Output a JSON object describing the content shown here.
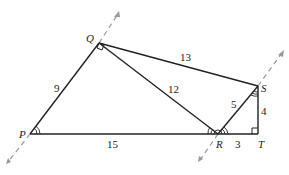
{
  "diagram": {
    "type": "geometry",
    "points": {
      "P": {
        "label": "P",
        "x": 30,
        "y": 134
      },
      "Q": {
        "label": "Q",
        "x": 99,
        "y": 43
      },
      "R": {
        "label": "R",
        "x": 218,
        "y": 134
      },
      "S": {
        "label": "S",
        "x": 258,
        "y": 86
      },
      "T": {
        "label": "T",
        "x": 258,
        "y": 134
      }
    },
    "segments": [
      {
        "from": "P",
        "to": "Q",
        "length_label": "9"
      },
      {
        "from": "Q",
        "to": "S",
        "length_label": "13"
      },
      {
        "from": "Q",
        "to": "R",
        "length_label": "12"
      },
      {
        "from": "P",
        "to": "R",
        "length_label": "15"
      },
      {
        "from": "R",
        "to": "S",
        "length_label": "5"
      },
      {
        "from": "S",
        "to": "T",
        "length_label": "4"
      },
      {
        "from": "R",
        "to": "T",
        "length_label": "3"
      }
    ],
    "labels": {
      "p": "P",
      "q": "Q",
      "r": "R",
      "s": "S",
      "t": "T",
      "pq": "9",
      "qs": "13",
      "qr": "12",
      "pr": "15",
      "rs": "5",
      "st": "4",
      "rt": "3"
    },
    "right_angles": [
      "Q",
      "T"
    ],
    "dashed_extensions": [
      "line PQ",
      "line RS"
    ]
  }
}
